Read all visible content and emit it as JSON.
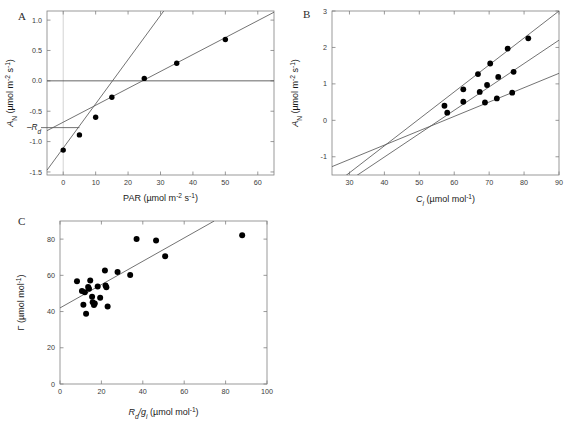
{
  "figure": {
    "panels": [
      {
        "letter": "A",
        "xlabel_parts": {
          "sym": "PAR",
          "unit": "(µmol m⁻² s⁻¹)"
        },
        "ylabel_parts": {
          "sym": "A",
          "sub": "N",
          "unit": " (µmol m⁻² s⁻¹)"
        },
        "annotation": "–R",
        "annotation_sub": "d"
      },
      {
        "letter": "B",
        "xlabel_parts": {
          "sym": "C",
          "sub": "i",
          "unit": " (µmol mol⁻¹)"
        },
        "ylabel_parts": {
          "sym": "A",
          "sub": "N",
          "unit": " (µmol m⁻² s⁻¹)"
        }
      },
      {
        "letter": "C",
        "xlabel_parts": {
          "sym": "R",
          "sub": "d",
          "sym2": "/g",
          "sub2": "i",
          "unit": " (µmol mol⁻¹)"
        },
        "ylabel_parts": {
          "sym": "Γ",
          "unit": " (µmol mol⁻¹)"
        }
      }
    ]
  },
  "chart_data": [
    {
      "type": "scatter",
      "panel": "A",
      "title": "A",
      "xlabel": "PAR (µmol m⁻² s⁻¹)",
      "ylabel": "A_N (µmol m⁻² s⁻¹)",
      "xlim": [
        -5,
        65
      ],
      "ylim": [
        -1.55,
        1.15
      ],
      "xticks": [
        0,
        10,
        20,
        30,
        40,
        50,
        60
      ],
      "yticks": [
        -1.5,
        -1.0,
        -0.5,
        0.0,
        0.5,
        1.0
      ],
      "ytick_labels": [
        "-1.5",
        "-1.0",
        "-0.5",
        "0.0",
        "0.5",
        "1.0"
      ],
      "grid": false,
      "legend": "none",
      "points": [
        {
          "x": 0,
          "y": -1.14
        },
        {
          "x": 5,
          "y": -0.89
        },
        {
          "x": 10,
          "y": -0.6
        },
        {
          "x": 15,
          "y": -0.27
        },
        {
          "x": 25,
          "y": 0.04
        },
        {
          "x": 35,
          "y": 0.29
        },
        {
          "x": 50,
          "y": 0.68
        }
      ],
      "lines": [
        {
          "name": "steep-initial-slope",
          "x": [
            -5,
            31
          ],
          "y": [
            -1.47,
            1.15
          ]
        },
        {
          "name": "shallow-saturating-fit",
          "x": [
            -5,
            65
          ],
          "y": [
            -0.82,
            1.13
          ]
        }
      ],
      "reference_lines": [
        {
          "name": "zero-line",
          "orientation": "horizontal",
          "value": 0.0
        },
        {
          "name": "x-zero-line",
          "orientation": "vertical",
          "value": 0
        },
        {
          "name": "Rd-level",
          "orientation": "horizontal",
          "value": -0.77,
          "x_to": 5
        }
      ],
      "annotations": [
        {
          "text": "–Rd",
          "x": -5,
          "y": -0.77
        }
      ]
    },
    {
      "type": "scatter",
      "panel": "B",
      "title": "B",
      "xlabel": "C_i (µmol mol⁻¹)",
      "ylabel": "A_N (µmol m⁻² s⁻¹)",
      "xlim": [
        25,
        90
      ],
      "ylim": [
        -1.5,
        3.0
      ],
      "xticks": [
        30,
        40,
        50,
        60,
        70,
        80,
        90
      ],
      "yticks": [
        -1,
        0,
        1,
        2,
        3
      ],
      "ytick_labels": [
        "-1",
        "0",
        "1",
        "2",
        "3"
      ],
      "grid": false,
      "legend": "none",
      "series": [
        {
          "name": "high-light",
          "points": [
            {
              "x": 57.2,
              "y": 0.4
            },
            {
              "x": 62.6,
              "y": 0.85
            },
            {
              "x": 66.8,
              "y": 1.27
            },
            {
              "x": 70.3,
              "y": 1.56
            },
            {
              "x": 75.3,
              "y": 1.97
            },
            {
              "x": 81.2,
              "y": 2.25
            }
          ],
          "line": {
            "x": [
              28.5,
              90
            ],
            "y": [
              -1.55,
              3.0
            ]
          }
        },
        {
          "name": "medium-light",
          "points": [
            {
              "x": 58.0,
              "y": 0.21
            },
            {
              "x": 62.6,
              "y": 0.51
            },
            {
              "x": 67.3,
              "y": 0.78
            },
            {
              "x": 69.4,
              "y": 0.97
            },
            {
              "x": 72.6,
              "y": 1.19
            },
            {
              "x": 77.0,
              "y": 1.33
            }
          ],
          "line": {
            "x": [
              32.0,
              90
            ],
            "y": [
              -1.52,
              2.2
            ]
          }
        },
        {
          "name": "low-light",
          "points": [
            {
              "x": 68.8,
              "y": 0.49
            },
            {
              "x": 72.2,
              "y": 0.6
            },
            {
              "x": 76.6,
              "y": 0.76
            }
          ],
          "line": {
            "x": [
              25,
              90
            ],
            "y": [
              -1.27,
              1.29
            ]
          }
        }
      ],
      "convergence_point": {
        "x": 46,
        "y": -0.45
      }
    },
    {
      "type": "scatter",
      "panel": "C",
      "title": "C",
      "xlabel": "R_d/g_i (µmol mol⁻¹)",
      "ylabel": "Γ (µmol mol⁻¹)",
      "xlim": [
        0,
        100
      ],
      "ylim": [
        0,
        90
      ],
      "xticks": [
        0,
        20,
        40,
        60,
        80,
        100
      ],
      "yticks": [
        0,
        20,
        40,
        60,
        80
      ],
      "ytick_labels": [
        "0",
        "20",
        "40",
        "60",
        "80"
      ],
      "grid": false,
      "legend": "none",
      "points": [
        {
          "x": 8.2,
          "y": 56.7
        },
        {
          "x": 10.6,
          "y": 51.3
        },
        {
          "x": 11.3,
          "y": 43.8
        },
        {
          "x": 12.0,
          "y": 50.6
        },
        {
          "x": 12.6,
          "y": 38.8
        },
        {
          "x": 13.6,
          "y": 53.5
        },
        {
          "x": 14.0,
          "y": 52.6
        },
        {
          "x": 14.6,
          "y": 57.2
        },
        {
          "x": 15.5,
          "y": 48.2
        },
        {
          "x": 15.8,
          "y": 45.1
        },
        {
          "x": 16.4,
          "y": 43.6
        },
        {
          "x": 16.8,
          "y": 44.4
        },
        {
          "x": 18.2,
          "y": 53.9
        },
        {
          "x": 19.4,
          "y": 47.6
        },
        {
          "x": 21.7,
          "y": 62.6
        },
        {
          "x": 22.0,
          "y": 54.4
        },
        {
          "x": 22.4,
          "y": 53.4
        },
        {
          "x": 23.0,
          "y": 42.8
        },
        {
          "x": 27.8,
          "y": 61.9
        },
        {
          "x": 33.9,
          "y": 60.2
        },
        {
          "x": 37.0,
          "y": 80.1
        },
        {
          "x": 46.4,
          "y": 79.3
        },
        {
          "x": 50.8,
          "y": 70.6
        },
        {
          "x": 88.0,
          "y": 82.2
        }
      ],
      "lines": [
        {
          "name": "regression-line",
          "x": [
            0,
            74.5
          ],
          "y": [
            42.0,
            90.0
          ]
        }
      ]
    }
  ]
}
